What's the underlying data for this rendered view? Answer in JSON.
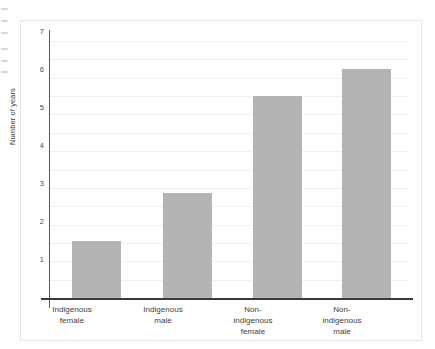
{
  "chart_data": {
    "type": "bar",
    "title": "",
    "subtitle": "",
    "xlabel": "",
    "ylabel": "Number of years",
    "categories": [
      "Indigenous female",
      "Indigenous male",
      "Non-indigenous female",
      "Non-indigenous male"
    ],
    "category_lines": [
      [
        "Indigenous",
        "female"
      ],
      [
        "Indigenous",
        "male"
      ],
      [
        "Non-",
        "indigenous",
        "female"
      ],
      [
        "Non-",
        "indigenous",
        "male"
      ]
    ],
    "values": [
      1.55,
      2.85,
      5.5,
      6.25
    ],
    "ylim": [
      0,
      7.3
    ],
    "ytick_labels": [
      "1",
      "2",
      "3",
      "4",
      "5",
      "6",
      "7"
    ],
    "ytick_values": [
      1,
      2,
      3,
      4,
      5,
      6,
      7
    ],
    "gridlines": [
      0.5,
      1,
      1.5,
      2,
      2.5,
      3,
      3.5,
      4,
      4.5,
      5,
      5.5,
      6,
      6.5,
      7
    ],
    "grid": true,
    "legend": "none",
    "bar_color": "#b4b4b4",
    "axis_color": "#3a3a3a",
    "grid_color": "#f0f0f0",
    "background": "#ffffff"
  },
  "figure": {
    "frame_color": "#e6e6e6",
    "margin_marks": [
      "",
      "",
      "",
      "",
      "",
      ""
    ]
  }
}
